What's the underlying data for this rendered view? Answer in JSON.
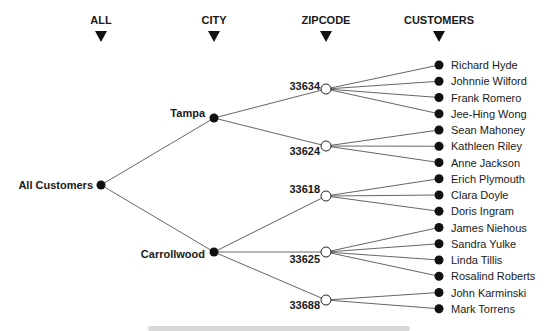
{
  "headers": [
    {
      "label": "ALL",
      "x": 101
    },
    {
      "label": "CITY",
      "x": 214
    },
    {
      "label": "ZIPCODE",
      "x": 326
    },
    {
      "label": "CUSTOMERS",
      "x": 439
    }
  ],
  "root": {
    "label": "All Customers",
    "x": 101,
    "y": 185
  },
  "cities": [
    {
      "label": "Tampa",
      "x": 214,
      "y": 118
    },
    {
      "label": "Carrollwood",
      "x": 214,
      "y": 252
    }
  ],
  "zipcodes": [
    {
      "label": "33634",
      "city": 0,
      "x": 326,
      "y": 89,
      "lx": 308,
      "ly": 90
    },
    {
      "label": "33624",
      "city": 0,
      "x": 326,
      "y": 146,
      "lx": 308,
      "ly": 155
    },
    {
      "label": "33618",
      "city": 1,
      "x": 326,
      "y": 196,
      "lx": 308,
      "ly": 193
    },
    {
      "label": "33625",
      "city": 1,
      "x": 326,
      "y": 252,
      "lx": 308,
      "ly": 263
    },
    {
      "label": "33688",
      "city": 1,
      "x": 326,
      "y": 300,
      "lx": 308,
      "ly": 309
    }
  ],
  "customers": [
    {
      "name": "Richard Hyde",
      "zip": 0
    },
    {
      "name": "Johnnie Wilford",
      "zip": 0
    },
    {
      "name": "Frank Romero",
      "zip": 0
    },
    {
      "name": "Jee-Hing Wong",
      "zip": 0
    },
    {
      "name": "Sean Mahoney",
      "zip": 1
    },
    {
      "name": "Kathleen Riley",
      "zip": 1
    },
    {
      "name": "Anne Jackson",
      "zip": 1
    },
    {
      "name": "Erich Plymouth",
      "zip": 2
    },
    {
      "name": "Clara Doyle",
      "zip": 2
    },
    {
      "name": "Doris Ingram",
      "zip": 2
    },
    {
      "name": "James Niehous",
      "zip": 3
    },
    {
      "name": "Sandra Yulke",
      "zip": 3
    },
    {
      "name": "Linda Tillis",
      "zip": 3
    },
    {
      "name": "Rosalind Roberts",
      "zip": 3
    },
    {
      "name": "John Karminski",
      "zip": 4
    },
    {
      "name": "Mark Torrens",
      "zip": 4
    }
  ],
  "customer_layout": {
    "x": 439,
    "y0": 65,
    "dy": 16.25
  },
  "colors": {
    "text": "#1a1a1a",
    "edge": "#555555",
    "node_filled": "#111111",
    "node_hollow_stroke": "#222222"
  }
}
